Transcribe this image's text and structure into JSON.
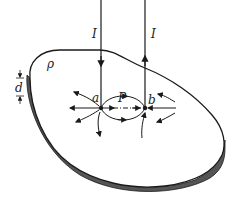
{
  "labels": {
    "current_left": "I",
    "current_right": "I",
    "resistivity": "ρ",
    "thickness": "d",
    "point_a": "a",
    "point_b": "b",
    "point_p": "P"
  },
  "colors": {
    "line": "#1a1a1a",
    "edge_fill": "#555555"
  }
}
